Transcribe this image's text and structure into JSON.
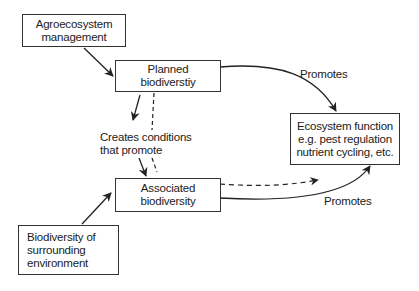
{
  "nodes": {
    "agroecosystem": {
      "lines": [
        "Agroecosystem",
        "management"
      ]
    },
    "planned": {
      "lines": [
        "Planned",
        "biodiverstiy"
      ]
    },
    "ecosystem": {
      "lines": [
        "Ecosystem function",
        "e.g. pest regulation",
        "nutrient cycling, etc."
      ]
    },
    "associated": {
      "lines": [
        "Associated",
        "biodiversity"
      ]
    },
    "surrounding": {
      "lines": [
        "Biodiversity of",
        "surrounding",
        "environment"
      ]
    }
  },
  "edges": {
    "creates_label": [
      "Creates conditions",
      "that promote"
    ],
    "promotes_top": "Promotes",
    "promotes_bottom": "Promotes"
  },
  "colors": {
    "stroke": "#222222",
    "background": "#ffffff"
  }
}
